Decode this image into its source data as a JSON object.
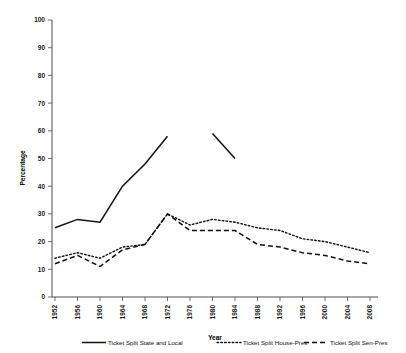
{
  "chart_data": {
    "type": "line",
    "title": "",
    "xlabel": "Year",
    "ylabel": "Percentage",
    "ylim": [
      0,
      100
    ],
    "ytick_step": 10,
    "grid": false,
    "legend_position": "bottom",
    "categories": [
      1952,
      1956,
      1960,
      1964,
      1968,
      1972,
      1976,
      1980,
      1984,
      1988,
      1992,
      1996,
      2000,
      2004,
      2008
    ],
    "yticks": [
      0,
      10,
      20,
      30,
      40,
      50,
      60,
      70,
      80,
      90,
      100
    ],
    "xticks": [
      "1952",
      "1956",
      "1960",
      "1964",
      "1968",
      "1972",
      "1976",
      "1980",
      "1984",
      "1988",
      "1992",
      "1996",
      "2000",
      "2004",
      "2008"
    ],
    "series": [
      {
        "name": "Ticket Split State and Local",
        "style": "solid",
        "color": "#111111",
        "values": [
          25,
          28,
          27,
          40,
          48,
          58,
          null,
          59,
          50,
          null,
          null,
          null,
          null,
          null,
          null
        ]
      },
      {
        "name": "Ticket Split House-Pres",
        "style": "dotted",
        "color": "#111111",
        "values": [
          14,
          16,
          14,
          18,
          19,
          30,
          26,
          28,
          27,
          25,
          24,
          21,
          20,
          18,
          16
        ]
      },
      {
        "name": "Ticket Split Sen-Pres",
        "style": "dashed",
        "color": "#111111",
        "values": [
          12,
          15,
          11,
          17,
          19,
          30,
          24,
          24,
          24,
          19,
          18,
          16,
          15,
          13,
          12
        ]
      }
    ]
  },
  "legend": {
    "items": [
      {
        "label": "Ticket Split State and Local",
        "swatch": "solid-line-swatch"
      },
      {
        "label": "Ticket Split House-Pres",
        "swatch": "dotted-line-swatch"
      },
      {
        "label": "Ticket Split Sen-Pres",
        "swatch": "dashed-line-swatch"
      }
    ]
  }
}
